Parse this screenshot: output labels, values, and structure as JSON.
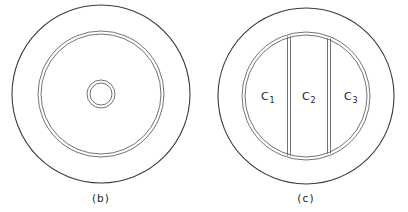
{
  "figure": {
    "background_color": "#ffffff",
    "line_color": "#3a3a3a",
    "inner_line_color": "#5a5a5a",
    "panels": [
      {
        "id": "panel-b",
        "caption": "(b)",
        "description": "Concentric circular cross-section with outer rim, inner ring and central hub",
        "center_x": 101,
        "center_y": 94,
        "outer_radius": 89,
        "inner_ring_outer_radius": 63,
        "inner_ring_inner_radius": 60,
        "hub_outer_radius": 14,
        "hub_inner_radius": 11,
        "caption_x": 101,
        "caption_y": 202
      },
      {
        "id": "panel-c",
        "caption": "(c)",
        "description": "Circular cross-section with inner circle divided into three vertical regions",
        "center_x": 306,
        "center_y": 96,
        "outer_radius": 88,
        "inner_circle_outer_radius": 64,
        "inner_circle_inner_radius": 61,
        "caption_x": 306,
        "caption_y": 202,
        "divider_x_positions": [
          289,
          329
        ],
        "regions": [
          {
            "label": "C",
            "subscript": "1",
            "label_x": 265,
            "label_y": 100
          },
          {
            "label": "C",
            "subscript": "2",
            "label_x": 309,
            "label_y": 100
          },
          {
            "label": "C",
            "subscript": "3",
            "label_x": 351,
            "label_y": 100
          }
        ]
      }
    ]
  }
}
